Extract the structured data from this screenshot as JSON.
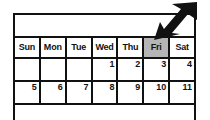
{
  "app": {
    "name": "calendar-widget",
    "background_color": "#ffffff",
    "line_color": "#111111",
    "highlight_color": "#b5b5b5"
  },
  "calendar": {
    "title_bar_text": "",
    "weekday_headers": [
      {
        "label": "Sun",
        "highlighted": false
      },
      {
        "label": "Mon",
        "highlighted": false
      },
      {
        "label": "Tue",
        "highlighted": false
      },
      {
        "label": "Wed",
        "highlighted": false
      },
      {
        "label": "Thu",
        "highlighted": false
      },
      {
        "label": "Fri",
        "highlighted": true
      },
      {
        "label": "Sat",
        "highlighted": false
      }
    ],
    "weeks": [
      {
        "days": [
          "",
          "",
          "",
          "1",
          "2",
          "3",
          "4"
        ]
      },
      {
        "days": [
          "5",
          "6",
          "7",
          "8",
          "9",
          "10",
          "11"
        ]
      }
    ],
    "selected_column": "Fri"
  },
  "pointer": {
    "icon": "arrow-cursor-icon",
    "direction": "down-left",
    "target": "Fri",
    "color": "#111111"
  }
}
